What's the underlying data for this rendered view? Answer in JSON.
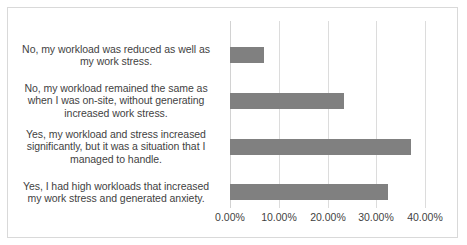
{
  "chart_data": {
    "type": "bar",
    "orientation": "horizontal",
    "title": "",
    "subtitle": "",
    "xlabel": "",
    "ylabel": "",
    "xlim": [
      0,
      0.42
    ],
    "grid": true,
    "legend": false,
    "bar_color": "#808080",
    "gridline_color": "#dcdcdc",
    "text_color": "#3f3f3f",
    "border_color": "#d9d9d9",
    "categories": [
      "Yes, I had high workloads that increased my work stress and generated anxiety.",
      "Yes, my workload and stress increased significantly, but it was a situation that I managed to handle.",
      "No, my workload remained the same as when I was on-site, without generating increased work stress.",
      "No, my workload was reduced as well as my work stress."
    ],
    "values": [
      0.325,
      0.372,
      0.234,
      0.07
    ],
    "value_labels": [
      "32.50%",
      "37.20%",
      "23.40%",
      "7.00%"
    ],
    "ticks": [
      0,
      0.1,
      0.2,
      0.3,
      0.4
    ],
    "tick_labels": [
      "0.00%",
      "10.00%",
      "20.00%",
      "30.00%",
      "40.00%"
    ]
  },
  "axis": {
    "tick_0": "0.00%",
    "tick_1": "10.00%",
    "tick_2": "20.00%",
    "tick_3": "30.00%",
    "tick_4": "40.00%"
  },
  "categories": {
    "cat_0": "No, my workload was reduced as well as my work stress.",
    "cat_1": "No, my workload remained the same as when I was on-site, without generating increased work stress.",
    "cat_2": "Yes, my workload and stress increased significantly, but it was a situation that I managed to handle.",
    "cat_3": "Yes, I had high workloads that increased my work stress and generated anxiety."
  }
}
